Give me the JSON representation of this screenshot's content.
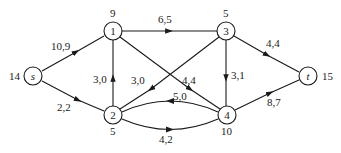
{
  "diagram": {
    "type": "flow-network",
    "nodes": [
      {
        "id": "s",
        "label": "s",
        "italic": true,
        "x": 33,
        "y": 76,
        "value": "14",
        "value_pos": "left"
      },
      {
        "id": "1",
        "label": "1",
        "italic": false,
        "x": 113,
        "y": 31,
        "value": "9",
        "value_pos": "top"
      },
      {
        "id": "2",
        "label": "2",
        "italic": false,
        "x": 113,
        "y": 115,
        "value": "5",
        "value_pos": "bottom"
      },
      {
        "id": "3",
        "label": "3",
        "italic": false,
        "x": 226,
        "y": 31,
        "value": "5",
        "value_pos": "top"
      },
      {
        "id": "4",
        "label": "4",
        "italic": false,
        "x": 227,
        "y": 115,
        "value": "10",
        "value_pos": "bottom"
      },
      {
        "id": "t",
        "label": "t",
        "italic": true,
        "x": 308,
        "y": 76,
        "value": "15",
        "value_pos": "right"
      }
    ],
    "edges": [
      {
        "from": "s",
        "to": "1",
        "label": "10,9"
      },
      {
        "from": "s",
        "to": "2",
        "label": "2,2"
      },
      {
        "from": "2",
        "to": "1",
        "label": "3,0"
      },
      {
        "from": "1",
        "to": "3",
        "label": "6,5"
      },
      {
        "from": "1",
        "to": "4",
        "label": "4,4"
      },
      {
        "from": "3",
        "to": "2",
        "label": "3,0"
      },
      {
        "from": "3",
        "to": "4",
        "label": "3,1"
      },
      {
        "from": "3",
        "to": "t",
        "label": "4,4"
      },
      {
        "from": "4",
        "to": "2",
        "label": "5,0"
      },
      {
        "from": "2",
        "to": "4",
        "label": "4,2"
      },
      {
        "from": "4",
        "to": "t",
        "label": "8,7"
      }
    ]
  }
}
